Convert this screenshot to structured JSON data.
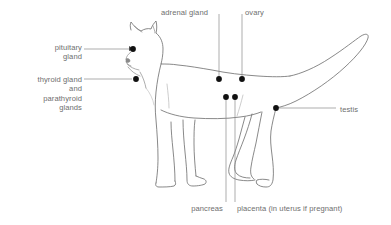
{
  "figure": {
    "background_color": "#ffffff",
    "outline_color": "#6b6b6b",
    "leader_color": "#8a8a8a",
    "marker_color": "#111111",
    "text_color": "#6e6e6e"
  },
  "labels": [
    {
      "id": "pituitary-gland",
      "text": "pituitary\ngland",
      "lines": [
        "pituitary",
        "gland"
      ],
      "align": "right",
      "x": 34,
      "y": 43,
      "width": 48,
      "leader": {
        "from_x": 84,
        "from_y": 49,
        "to_x": 129,
        "to_y": 49
      },
      "marker": {
        "x": 133,
        "y": 49
      }
    },
    {
      "id": "thyroid-and-parathyroid-glands",
      "text": "thyroid gland\nand\nparathyroid\nglands",
      "lines": [
        "thyroid gland",
        "and",
        "parathyroid",
        "glands"
      ],
      "align": "right",
      "x": 12,
      "y": 75,
      "width": 70,
      "leader": {
        "from_x": 84,
        "from_y": 79,
        "to_x": 132,
        "to_y": 79
      },
      "marker": {
        "x": 136,
        "y": 79
      }
    },
    {
      "id": "adrenal-gland",
      "text": "adrenal gland",
      "lines": [
        "adrenal gland"
      ],
      "align": "left",
      "x": 161,
      "y": 8,
      "width": 58,
      "leader": {
        "from_x": 219,
        "from_y": 14,
        "to_x": 219,
        "to_y": 76
      },
      "marker": {
        "x": 219,
        "y": 79
      }
    },
    {
      "id": "ovary",
      "text": "ovary",
      "lines": [
        "ovary"
      ],
      "align": "left",
      "x": 245,
      "y": 8,
      "width": 26,
      "leader": {
        "from_x": 242,
        "from_y": 14,
        "to_x": 242,
        "to_y": 76
      },
      "marker": {
        "x": 242,
        "y": 79
      }
    },
    {
      "id": "testis",
      "text": "testis",
      "lines": [
        "testis"
      ],
      "align": "left",
      "x": 340,
      "y": 105,
      "width": 28,
      "leader": {
        "from_x": 279,
        "from_y": 108,
        "to_x": 336,
        "to_y": 108
      },
      "marker": {
        "x": 276,
        "y": 108
      }
    },
    {
      "id": "pancreas",
      "text": "pancreas",
      "lines": [
        "pancreas"
      ],
      "align": "right",
      "x": 180,
      "y": 204,
      "width": 43,
      "leader": {
        "from_x": 226,
        "from_y": 100,
        "to_x": 226,
        "to_y": 202
      },
      "marker": {
        "x": 226,
        "y": 97
      }
    },
    {
      "id": "placenta",
      "text": "placenta (in uterus if pregnant)",
      "lines": [
        "placenta (in uterus if pregnant)"
      ],
      "align": "left",
      "x": 237,
      "y": 204,
      "width": 144,
      "leader": {
        "from_x": 235,
        "from_y": 100,
        "to_x": 235,
        "to_y": 202
      },
      "marker": {
        "x": 235,
        "y": 97
      }
    }
  ]
}
